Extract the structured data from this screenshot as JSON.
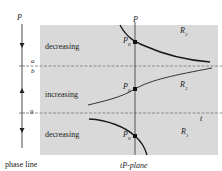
{
  "phase_line": {
    "axis_label": "P",
    "levels": [
      {
        "label_top": "a",
        "label_bottom": "b",
        "desc": "a/b"
      },
      {
        "label": "0"
      }
    ],
    "arrows": [
      "down",
      "up",
      "down"
    ],
    "caption": "phase line"
  },
  "plane": {
    "axis_p_label": "P",
    "axis_t_label": "t",
    "caption_t": "t",
    "caption_rest": "P-plane",
    "regions": [
      {
        "label": "decreasing",
        "name": "R",
        "sub": "3"
      },
      {
        "label": "increasing",
        "name": "R",
        "sub": "2"
      },
      {
        "label": "decreasing",
        "name": "R",
        "sub": "1"
      }
    ],
    "point_label": "P",
    "point_sub": "0",
    "colors": {
      "shade": "#d9d9d9",
      "curve": "#1a1a1a",
      "dashed": "#777777"
    }
  }
}
